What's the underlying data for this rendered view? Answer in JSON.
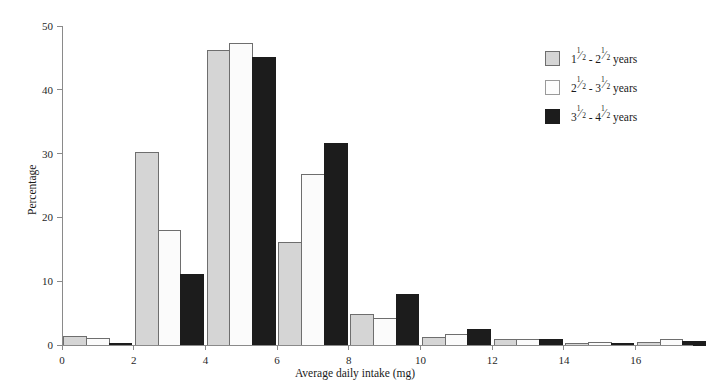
{
  "chart_data": {
    "type": "bar",
    "title": "",
    "subtitle": "",
    "xlabel": "Average daily intake (mg)",
    "ylabel": "Percentage",
    "xlim": [
      0,
      17.6
    ],
    "ylim": [
      0,
      50
    ],
    "grid": false,
    "legend_position": "right",
    "x_ticks": [
      0,
      2,
      4,
      6,
      8,
      10,
      12,
      14,
      16
    ],
    "x_tick_labels": [
      "0",
      "2",
      "4",
      "6",
      "8",
      "10",
      "12",
      "14",
      "16"
    ],
    "y_ticks": [
      0,
      10,
      20,
      30,
      40,
      50
    ],
    "y_tick_labels": [
      "0",
      "10",
      "20",
      "30",
      "40",
      "50"
    ],
    "categories": [
      "0-2",
      "2-4",
      "4-6",
      "6-8",
      "8-10",
      "10-12",
      "12-14",
      "14-16",
      "16-18"
    ],
    "bin_starts": [
      0,
      2,
      4,
      6,
      8,
      10,
      12,
      14,
      16
    ],
    "bin_width": 2,
    "series": [
      {
        "name": "1½ - 2½ years",
        "color": "#d5d5d5",
        "edge_color": "#6e6e6e",
        "values": [
          1.3,
          30.2,
          46.2,
          16.0,
          4.8,
          1.2,
          0.8,
          0.2,
          0.4
        ]
      },
      {
        "name": "2½ - 3½ years",
        "color": "#fbfbfb",
        "edge_color": "#6e6e6e",
        "values": [
          1.0,
          18.0,
          47.3,
          26.8,
          4.1,
          1.7,
          0.9,
          0.4,
          0.9
        ]
      },
      {
        "name": "3½ - 4½ years",
        "color": "#1c1c1c",
        "edge_color": "#1c1c1c",
        "values": [
          0.2,
          11.0,
          45.0,
          31.6,
          7.9,
          2.5,
          0.9,
          0.2,
          0.6
        ]
      }
    ]
  },
  "legend": {
    "items": [
      {
        "whole_lo": "1",
        "num_lo": "1",
        "den_lo": "2",
        "dash": "-",
        "whole_hi": "2",
        "num_hi": "1",
        "den_hi": "2",
        "unit": "years",
        "swatch": "#d5d5d5",
        "swatch_border": "#6e6e6e",
        "name": "legend-item-1.5-2.5-years"
      },
      {
        "whole_lo": "2",
        "num_lo": "1",
        "den_lo": "2",
        "dash": "-",
        "whole_hi": "3",
        "num_hi": "1",
        "den_hi": "2",
        "unit": "years",
        "swatch": "#fdfdfd",
        "swatch_border": "#9a9a9a",
        "name": "legend-item-2.5-3.5-years"
      },
      {
        "whole_lo": "3",
        "num_lo": "1",
        "den_lo": "2",
        "dash": "-",
        "whole_hi": "4",
        "num_hi": "1",
        "den_hi": "2",
        "unit": "years",
        "swatch": "#1c1c1c",
        "swatch_border": "#1c1c1c",
        "name": "legend-item-3.5-4.5-years"
      }
    ]
  },
  "axes": {
    "axis_color": "#8a8a8a",
    "text_color": "#1a1a1a"
  },
  "geometry": {
    "plot_left": 62,
    "plot_right": 693,
    "plot_top": 26,
    "plot_bottom": 345
  }
}
